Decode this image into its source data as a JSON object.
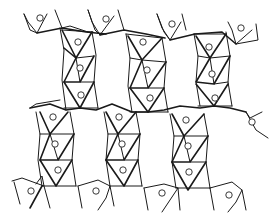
{
  "diagram": {
    "type": "crystal-structure-polyhedra",
    "columns_upper": [
      {
        "x": 78,
        "y_top": 38,
        "y_bottom": 110,
        "atoms": [
          [
            78,
            42
          ],
          [
            80,
            68
          ],
          [
            81,
            95
          ]
        ]
      },
      {
        "x": 148,
        "y_top": 34,
        "y_bottom": 110,
        "atoms": [
          [
            143,
            42
          ],
          [
            147,
            70
          ],
          [
            150,
            98
          ]
        ]
      },
      {
        "x": 212,
        "y_top": 32,
        "y_bottom": 106,
        "atoms": [
          [
            209,
            47
          ],
          [
            212,
            74
          ],
          [
            215,
            98
          ]
        ]
      }
    ],
    "columns_lower": [
      {
        "x": 55,
        "y_top": 112,
        "y_bottom": 188,
        "atoms": [
          [
            53,
            117
          ],
          [
            55,
            144
          ],
          [
            58,
            170
          ]
        ]
      },
      {
        "x": 121,
        "y_top": 112,
        "y_bottom": 186,
        "atoms": [
          [
            119,
            117
          ],
          [
            122,
            144
          ],
          [
            123,
            170
          ]
        ]
      },
      {
        "x": 187,
        "y_top": 114,
        "y_bottom": 190,
        "atoms": [
          [
            186,
            120
          ],
          [
            188,
            146
          ],
          [
            189,
            172
          ]
        ]
      }
    ],
    "top_tetrahedra_atoms": [
      [
        40,
        18
      ],
      [
        106,
        19
      ],
      [
        172,
        24
      ],
      [
        241,
        28
      ]
    ],
    "bottom_tetrahedra_atoms": [
      [
        31,
        191
      ],
      [
        96,
        191
      ],
      [
        162,
        193
      ],
      [
        229,
        195
      ]
    ],
    "right_edge_atoms": [
      [
        252,
        122
      ]
    ],
    "colors": {
      "line": "#1a1a1a",
      "background": "#ffffff"
    }
  }
}
